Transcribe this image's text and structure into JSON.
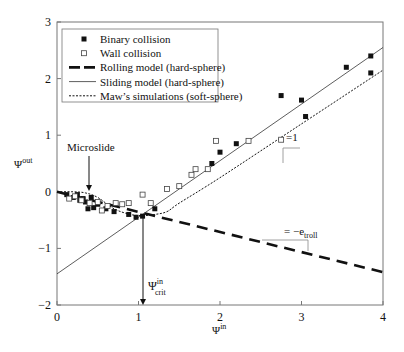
{
  "chart_data": {
    "type": "scatter",
    "title": "",
    "xlabel": "Ψin",
    "ylabel": "Ψout",
    "xlim": [
      0,
      4
    ],
    "ylim": [
      -2,
      3
    ],
    "xticks": [
      0,
      1,
      2,
      3,
      4
    ],
    "yticks": [
      -2,
      -1,
      0,
      1,
      2,
      3
    ],
    "grid": false,
    "legend_position": "upper left",
    "legend": [
      {
        "label": "Binary collision",
        "marker": "filled-square"
      },
      {
        "label": "Wall collision",
        "marker": "open-square"
      },
      {
        "label": "Rolling model (hard-sphere)",
        "style": "long-dash-thick"
      },
      {
        "label": "Sliding model (hard-sphere)",
        "style": "solid-thin"
      },
      {
        "label": "Maw’s simulations (soft-sphere)",
        "style": "dotted"
      }
    ],
    "series": [
      {
        "name": "Binary collision",
        "type": "scatter",
        "x": [
          0.12,
          0.2,
          0.25,
          0.28,
          0.32,
          0.35,
          0.38,
          0.42,
          0.45,
          0.5,
          0.6,
          0.7,
          0.88,
          0.97,
          1.05,
          1.2,
          1.9,
          2.0,
          2.2,
          2.75,
          3.0,
          3.05,
          3.55,
          3.85,
          3.85
        ],
        "y": [
          -0.05,
          -0.1,
          -0.05,
          -0.15,
          -0.12,
          -0.18,
          -0.3,
          -0.1,
          -0.28,
          -0.22,
          -0.3,
          -0.35,
          -0.4,
          -0.45,
          -0.43,
          -0.3,
          0.5,
          0.7,
          0.85,
          1.7,
          1.62,
          1.33,
          2.2,
          2.4,
          2.1
        ]
      },
      {
        "name": "Wall collision",
        "type": "scatter",
        "x": [
          0.15,
          0.22,
          0.3,
          0.4,
          0.5,
          0.55,
          0.62,
          0.72,
          0.8,
          0.88,
          1.05,
          1.15,
          1.35,
          1.5,
          1.65,
          1.7,
          1.85,
          1.95,
          2.35,
          2.75
        ],
        "y": [
          -0.12,
          -0.08,
          -0.15,
          -0.2,
          -0.18,
          -0.33,
          -0.25,
          -0.2,
          -0.22,
          -0.2,
          -0.05,
          -0.2,
          0.05,
          0.1,
          0.3,
          0.4,
          0.4,
          0.9,
          0.9,
          0.92
        ]
      },
      {
        "name": "Rolling model (hard-sphere)",
        "type": "line",
        "x": [
          0,
          4
        ],
        "y": [
          0,
          -1.42
        ]
      },
      {
        "name": "Sliding model (hard-sphere)",
        "type": "line",
        "x": [
          0,
          4
        ],
        "y": [
          -1.45,
          2.55
        ]
      },
      {
        "name": "Maw’s simulations (soft-sphere)",
        "type": "line",
        "x": [
          0,
          0.2,
          0.35,
          0.5,
          0.7,
          0.9,
          1.05,
          1.2,
          1.35,
          1.5,
          2.0,
          3.0,
          4.0
        ],
        "y": [
          0.0,
          0.0,
          -0.02,
          -0.1,
          -0.3,
          -0.4,
          -0.42,
          -0.4,
          -0.35,
          -0.2,
          0.25,
          1.2,
          2.15
        ]
      }
    ],
    "annotations": [
      {
        "text": "Microslide",
        "x": 0.35,
        "y": 0.4,
        "arrow_to": [
          0.38,
          -0.02
        ]
      },
      {
        "text": "Ψcrit in",
        "x": 1.05,
        "y": -1.65,
        "arrow_from": [
          1.05,
          -0.4
        ],
        "arrow_to": [
          1.05,
          -2.0
        ]
      },
      {
        "text": "=1",
        "note": "slope triangle on sliding line",
        "x": 2.9,
        "y": 1.65
      },
      {
        "text": "= −e_troll",
        "note": "slope triangle on rolling line",
        "x": 2.75,
        "y": -0.75
      }
    ]
  },
  "labels": {
    "xlabel_main": "Ψ",
    "xlabel_sup": "in",
    "ylabel_main": "Ψ",
    "ylabel_sup": "out",
    "microslide": "Microslide",
    "crit_main": "Ψ",
    "crit_sup": "in",
    "crit_sub": "crit",
    "slope_one": "=1",
    "slope_roll_prefix": "= −e",
    "slope_roll_sub": "troll"
  }
}
